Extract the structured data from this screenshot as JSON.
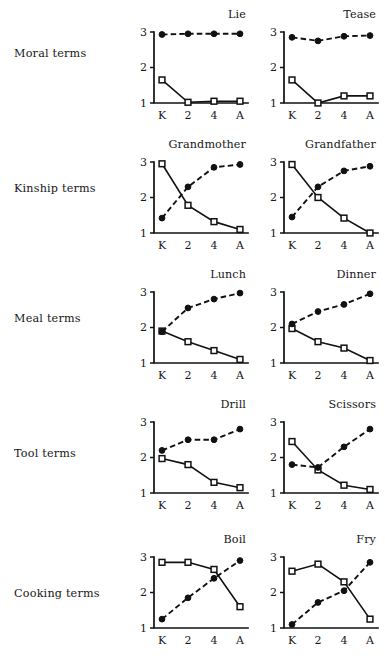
{
  "figure": {
    "x_categories": [
      "K",
      "2",
      "4",
      "A"
    ],
    "y_ticks": [
      "1",
      "2",
      "3"
    ],
    "y_min": 1,
    "y_max": 3,
    "series_names": [
      "solid-open-square",
      "dashed-filled-circle"
    ],
    "rows": [
      {
        "label": "Moral terms"
      },
      {
        "label": "Kinship terms"
      },
      {
        "label": "Meal terms"
      },
      {
        "label": "Tool terms"
      },
      {
        "label": "Cooking terms"
      }
    ],
    "panel_titles": [
      "Lie",
      "Tease",
      "Grandmother",
      "Grandfather",
      "Lunch",
      "Dinner",
      "Drill",
      "Scissors",
      "Boil",
      "Fry"
    ]
  },
  "chart_data": [
    {
      "type": "line",
      "title": "Lie",
      "group": "Moral terms",
      "categories": [
        "K",
        "2",
        "4",
        "A"
      ],
      "xlabel": "",
      "ylabel": "",
      "ylim": [
        1,
        3
      ],
      "yticks": [
        1,
        2,
        3
      ],
      "grid": false,
      "legend": "none",
      "series": [
        {
          "name": "solid-open-square",
          "marker": "open-square",
          "style": "solid",
          "values": [
            1.65,
            1.02,
            1.05,
            1.05
          ]
        },
        {
          "name": "dashed-filled-circle",
          "marker": "filled-circle",
          "style": "dashed",
          "values": [
            2.93,
            2.95,
            2.95,
            2.95
          ]
        }
      ]
    },
    {
      "type": "line",
      "title": "Tease",
      "group": "Moral terms",
      "categories": [
        "K",
        "2",
        "4",
        "A"
      ],
      "xlabel": "",
      "ylabel": "",
      "ylim": [
        1,
        3
      ],
      "yticks": [
        1,
        2,
        3
      ],
      "grid": false,
      "legend": "none",
      "series": [
        {
          "name": "solid-open-square",
          "marker": "open-square",
          "style": "solid",
          "values": [
            1.65,
            1.0,
            1.2,
            1.2
          ]
        },
        {
          "name": "dashed-filled-circle",
          "marker": "filled-circle",
          "style": "dashed",
          "values": [
            2.85,
            2.75,
            2.88,
            2.9
          ]
        }
      ]
    },
    {
      "type": "line",
      "title": "Grandmother",
      "group": "Kinship terms",
      "categories": [
        "K",
        "2",
        "4",
        "A"
      ],
      "xlabel": "",
      "ylabel": "",
      "ylim": [
        1,
        3
      ],
      "yticks": [
        1,
        2,
        3
      ],
      "grid": false,
      "legend": "none",
      "series": [
        {
          "name": "solid-open-square",
          "marker": "open-square",
          "style": "solid",
          "values": [
            2.95,
            1.78,
            1.32,
            1.1
          ]
        },
        {
          "name": "dashed-filled-circle",
          "marker": "filled-circle",
          "style": "dashed",
          "values": [
            1.42,
            2.3,
            2.85,
            2.93
          ]
        }
      ]
    },
    {
      "type": "line",
      "title": "Grandfather",
      "group": "Kinship terms",
      "categories": [
        "K",
        "2",
        "4",
        "A"
      ],
      "xlabel": "",
      "ylabel": "",
      "ylim": [
        1,
        3
      ],
      "yticks": [
        1,
        2,
        3
      ],
      "grid": false,
      "legend": "none",
      "series": [
        {
          "name": "solid-open-square",
          "marker": "open-square",
          "style": "solid",
          "values": [
            2.93,
            2.0,
            1.42,
            1.0
          ]
        },
        {
          "name": "dashed-filled-circle",
          "marker": "filled-circle",
          "style": "dashed",
          "values": [
            1.45,
            2.3,
            2.75,
            2.88
          ]
        }
      ]
    },
    {
      "type": "line",
      "title": "Lunch",
      "group": "Meal terms",
      "categories": [
        "K",
        "2",
        "4",
        "A"
      ],
      "xlabel": "",
      "ylabel": "",
      "ylim": [
        1,
        3
      ],
      "yticks": [
        1,
        2,
        3
      ],
      "grid": false,
      "legend": "none",
      "series": [
        {
          "name": "solid-open-square",
          "marker": "open-square",
          "style": "solid",
          "values": [
            1.9,
            1.6,
            1.35,
            1.1
          ]
        },
        {
          "name": "dashed-filled-circle",
          "marker": "filled-circle",
          "style": "dashed",
          "values": [
            1.88,
            2.55,
            2.8,
            2.97
          ]
        }
      ]
    },
    {
      "type": "line",
      "title": "Dinner",
      "group": "Meal terms",
      "categories": [
        "K",
        "2",
        "4",
        "A"
      ],
      "xlabel": "",
      "ylabel": "",
      "ylim": [
        1,
        3
      ],
      "yticks": [
        1,
        2,
        3
      ],
      "grid": false,
      "legend": "none",
      "series": [
        {
          "name": "solid-open-square",
          "marker": "open-square",
          "style": "solid",
          "values": [
            1.97,
            1.6,
            1.42,
            1.07
          ]
        },
        {
          "name": "dashed-filled-circle",
          "marker": "filled-circle",
          "style": "dashed",
          "values": [
            2.1,
            2.45,
            2.65,
            2.95
          ]
        }
      ]
    },
    {
      "type": "line",
      "title": "Drill",
      "group": "Tool terms",
      "categories": [
        "K",
        "2",
        "4",
        "A"
      ],
      "xlabel": "",
      "ylabel": "",
      "ylim": [
        1,
        3
      ],
      "yticks": [
        1,
        2,
        3
      ],
      "grid": false,
      "legend": "none",
      "series": [
        {
          "name": "solid-open-square",
          "marker": "open-square",
          "style": "solid",
          "values": [
            1.97,
            1.8,
            1.3,
            1.15
          ]
        },
        {
          "name": "dashed-filled-circle",
          "marker": "filled-circle",
          "style": "dashed",
          "values": [
            2.2,
            2.5,
            2.5,
            2.8
          ]
        }
      ]
    },
    {
      "type": "line",
      "title": "Scissors",
      "group": "Tool terms",
      "categories": [
        "K",
        "2",
        "4",
        "A"
      ],
      "xlabel": "",
      "ylabel": "",
      "ylim": [
        1,
        3
      ],
      "yticks": [
        1,
        2,
        3
      ],
      "grid": false,
      "legend": "none",
      "series": [
        {
          "name": "solid-open-square",
          "marker": "open-square",
          "style": "solid",
          "values": [
            2.45,
            1.65,
            1.22,
            1.1
          ]
        },
        {
          "name": "dashed-filled-circle",
          "marker": "filled-circle",
          "style": "dashed",
          "values": [
            1.8,
            1.72,
            2.3,
            2.8
          ]
        }
      ]
    },
    {
      "type": "line",
      "title": "Boil",
      "group": "Cooking terms",
      "categories": [
        "K",
        "2",
        "4",
        "A"
      ],
      "xlabel": "",
      "ylabel": "",
      "ylim": [
        1,
        3
      ],
      "yticks": [
        1,
        2,
        3
      ],
      "grid": false,
      "legend": "none",
      "series": [
        {
          "name": "solid-open-square",
          "marker": "open-square",
          "style": "solid",
          "values": [
            2.85,
            2.85,
            2.65,
            1.6
          ]
        },
        {
          "name": "dashed-filled-circle",
          "marker": "filled-circle",
          "style": "dashed",
          "values": [
            1.25,
            1.85,
            2.4,
            2.9
          ]
        }
      ]
    },
    {
      "type": "line",
      "title": "Fry",
      "group": "Cooking terms",
      "categories": [
        "K",
        "2",
        "4",
        "A"
      ],
      "xlabel": "",
      "ylabel": "",
      "ylim": [
        1,
        3
      ],
      "yticks": [
        1,
        2,
        3
      ],
      "grid": false,
      "legend": "none",
      "series": [
        {
          "name": "solid-open-square",
          "marker": "open-square",
          "style": "solid",
          "values": [
            2.6,
            2.8,
            2.3,
            1.25
          ]
        },
        {
          "name": "dashed-filled-circle",
          "marker": "filled-circle",
          "style": "dashed",
          "values": [
            1.1,
            1.72,
            2.05,
            2.85
          ]
        }
      ]
    }
  ]
}
